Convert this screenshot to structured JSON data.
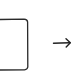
{
  "diagram": {
    "shapes": [
      {
        "type": "rectangle",
        "style": "hand-drawn",
        "partially_cropped": "left",
        "stroke": "#333333",
        "fill": "#ffffff",
        "label": ""
      },
      {
        "type": "arrow",
        "direction": "right",
        "style": "hand-drawn",
        "stroke": "#222222",
        "label": ""
      }
    ],
    "colors": {
      "background": "#ffffff",
      "stroke": "#2a2a2a"
    }
  }
}
